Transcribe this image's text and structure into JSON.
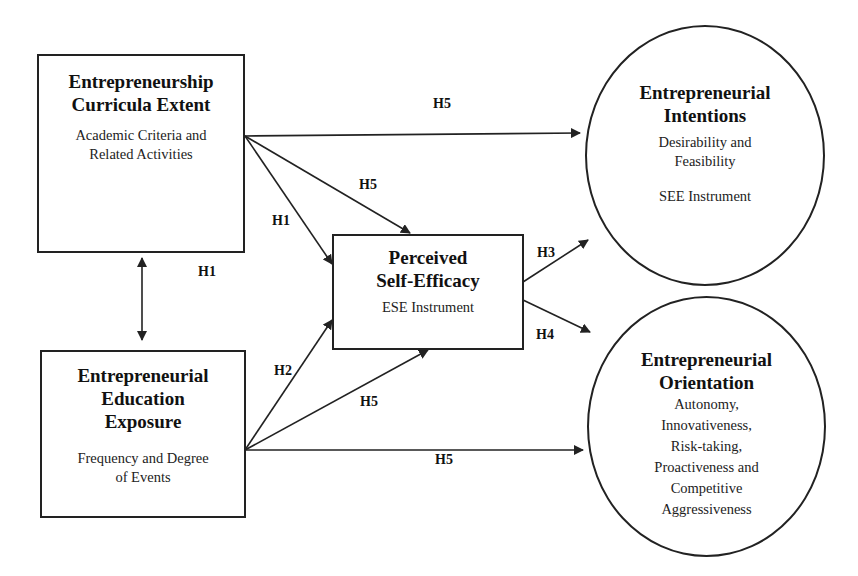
{
  "nodes": {
    "curricula": {
      "title_line1": "Entrepreneurship",
      "title_line2": "Curricula Extent",
      "sub_line1": "Academic Criteria and",
      "sub_line2": "Related Activities"
    },
    "exposure": {
      "title_line1": "Entrepreneurial",
      "title_line2": "Education",
      "title_line3": "Exposure",
      "sub_line1": "Frequency and Degree",
      "sub_line2": "of Events"
    },
    "self_efficacy": {
      "title_line1": "Perceived",
      "title_line2": "Self-Efficacy",
      "sub_line1": "ESE Instrument"
    },
    "intentions": {
      "title_line1": "Entrepreneurial",
      "title_line2": "Intentions",
      "sub_line1": "Desirability and",
      "sub_line2": "Feasibility",
      "sub_line3": "SEE Instrument"
    },
    "orientation": {
      "title_line1": "Entrepreneurial",
      "title_line2": "Orientation",
      "sub_line1": "Autonomy,",
      "sub_line2": "Innovativeness,",
      "sub_line3": "Risk-taking,",
      "sub_line4": "Proactiveness and",
      "sub_line5": "Competitive",
      "sub_line6": "Aggressiveness"
    }
  },
  "edge_labels": {
    "curricula_to_intentions": "H5",
    "curricula_to_efficacy_h5": "H5",
    "curricula_to_efficacy_h1": "H1",
    "curricula_exposure_h1": "H1",
    "efficacy_to_intentions": "H3",
    "efficacy_to_orientation": "H4",
    "exposure_to_efficacy_h2": "H2",
    "exposure_to_efficacy_h5": "H5",
    "exposure_to_orientation": "H5"
  },
  "colors": {
    "stroke": "#222222",
    "background": "#ffffff"
  }
}
